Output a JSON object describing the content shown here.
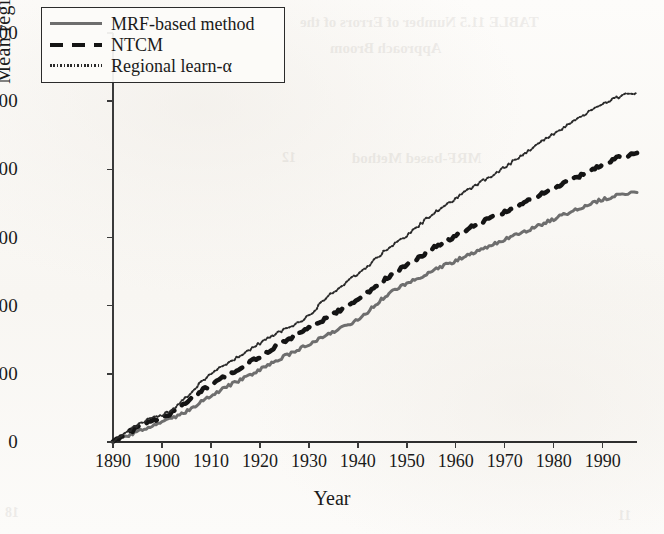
{
  "figure": {
    "background_color": "#fbfaf8",
    "ink_color": "#1a1a1a"
  },
  "axis_titles": {
    "x": "Year",
    "y": "Mean regional loss"
  },
  "legend": {
    "position": "upper-left-inside",
    "entries": [
      {
        "label": "MRF-based method",
        "style": "solid",
        "color": "#6e6e6e",
        "swatch": "legend-swatch-solid"
      },
      {
        "label": "NTCM",
        "style": "dashed",
        "color": "#141414",
        "swatch": "legend-swatch-dashed"
      },
      {
        "label": "Regional learn-α",
        "style": "dotted",
        "color": "#2a2a2a",
        "swatch": "legend-swatch-dotted"
      }
    ]
  },
  "ghost_text": [
    {
      "text": "TABLE 11.5    Number of Errors of the",
      "x": 300,
      "y": 14,
      "size": 15
    },
    {
      "text": "Approach  Broom",
      "x": 330,
      "y": 40,
      "size": 15
    },
    {
      "text": "MRF-based Method",
      "x": 352,
      "y": 150,
      "size": 15
    },
    {
      "text": "12",
      "x": 282,
      "y": 150,
      "size": 14
    },
    {
      "text": "18",
      "x": 5,
      "y": 505,
      "size": 14
    },
    {
      "text": "11",
      "x": 618,
      "y": 508,
      "size": 14
    }
  ],
  "chart_data": {
    "type": "line",
    "title": "",
    "xlabel": "Year",
    "ylabel": "Mean regional loss",
    "xlim": [
      1890,
      1997
    ],
    "ylim": [
      0,
      1200
    ],
    "xticks": [
      1890,
      1900,
      1910,
      1920,
      1930,
      1940,
      1950,
      1960,
      1970,
      1980,
      1990
    ],
    "yticks": [
      0,
      200,
      400,
      600,
      800,
      1000,
      1200
    ],
    "xticklabels": [
      "1890",
      "1900",
      "1910",
      "1920",
      "1930",
      "1940",
      "1950",
      "1960",
      "1970",
      "1980",
      "1990"
    ],
    "yticklabels": [
      "0",
      "200",
      "400",
      "600",
      "800",
      "1000",
      "1200"
    ],
    "grid": false,
    "legend_position": "upper left",
    "x": [
      1890,
      1892,
      1894,
      1896,
      1898,
      1900,
      1902,
      1904,
      1906,
      1908,
      1910,
      1912,
      1914,
      1916,
      1918,
      1920,
      1922,
      1924,
      1926,
      1928,
      1930,
      1932,
      1934,
      1936,
      1938,
      1940,
      1942,
      1944,
      1946,
      1948,
      1950,
      1952,
      1954,
      1956,
      1958,
      1960,
      1962,
      1964,
      1966,
      1968,
      1970,
      1972,
      1974,
      1976,
      1978,
      1980,
      1982,
      1984,
      1986,
      1988,
      1990,
      1992,
      1994,
      1997
    ],
    "series": [
      {
        "name": "MRF-based method",
        "style": "solid",
        "color": "#6e6e6e",
        "values": [
          0,
          12,
          24,
          36,
          46,
          56,
          68,
          82,
          98,
          118,
          136,
          152,
          168,
          182,
          196,
          212,
          228,
          244,
          258,
          272,
          288,
          302,
          318,
          330,
          344,
          358,
          382,
          408,
          432,
          450,
          464,
          478,
          494,
          508,
          520,
          532,
          546,
          558,
          570,
          582,
          594,
          606,
          618,
          630,
          642,
          654,
          666,
          678,
          690,
          702,
          712,
          720,
          726,
          732
        ]
      },
      {
        "name": "NTCM",
        "style": "dashed",
        "color": "#141414",
        "values": [
          0,
          18,
          34,
          50,
          62,
          72,
          86,
          104,
          126,
          150,
          168,
          186,
          202,
          218,
          234,
          250,
          268,
          286,
          302,
          318,
          334,
          350,
          368,
          384,
          400,
          418,
          438,
          460,
          482,
          502,
          520,
          538,
          556,
          574,
          590,
          606,
          622,
          636,
          650,
          664,
          676,
          690,
          702,
          716,
          730,
          744,
          758,
          772,
          786,
          800,
          814,
          828,
          838,
          848
        ]
      },
      {
        "name": "Regional learn-α",
        "style": "dotted",
        "color": "#2a2a2a",
        "values": [
          0,
          20,
          40,
          58,
          70,
          80,
          96,
          118,
          148,
          178,
          198,
          218,
          236,
          254,
          272,
          290,
          308,
          324,
          338,
          352,
          370,
          400,
          428,
          452,
          472,
          492,
          516,
          542,
          566,
          586,
          606,
          630,
          654,
          676,
          696,
          714,
          734,
          752,
          770,
          788,
          806,
          826,
          846,
          866,
          886,
          904,
          922,
          940,
          958,
          976,
          992,
          1006,
          1016,
          1026
        ]
      }
    ]
  }
}
